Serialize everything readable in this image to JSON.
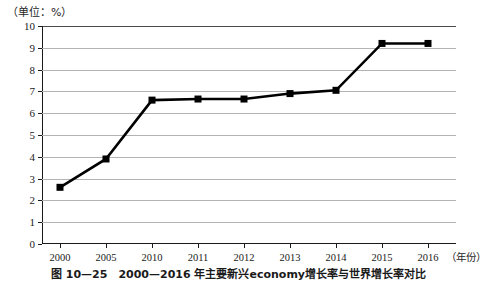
{
  "figure": {
    "unit_label": "（单位：%）",
    "caption": "图 10—25　2000—2016 年主要新兴economy增长率与世界增长率对比",
    "xaxis_name": "（年份）"
  },
  "chart_data": {
    "type": "line",
    "title": "",
    "subtitle": "",
    "xlabel": "（年份）",
    "ylabel": "（单位：%）",
    "categories": [
      "2000",
      "2005",
      "2010",
      "2011",
      "2012",
      "2013",
      "2014",
      "2015",
      "2016"
    ],
    "values": [
      2.6,
      3.9,
      6.6,
      6.65,
      6.65,
      6.9,
      7.05,
      9.2,
      9.2
    ],
    "ylim": [
      0,
      10
    ],
    "yticks": [
      0,
      1,
      2,
      3,
      4,
      5,
      6,
      7,
      8,
      9,
      10
    ],
    "ytick_labels": [
      "0",
      "1",
      "2",
      "3",
      "4",
      "5",
      "6",
      "7",
      "8",
      "9",
      "10"
    ],
    "grid": true,
    "grid_axis": "y",
    "legend": false,
    "legend_position": "none",
    "marker": "square",
    "line_color": "#000000",
    "marker_color": "#000000",
    "grid_color": "#b3b3b3",
    "series": [
      {
        "name": "增长率",
        "values": [
          2.6,
          3.9,
          6.6,
          6.65,
          6.65,
          6.9,
          7.05,
          9.2,
          9.2
        ]
      }
    ]
  }
}
